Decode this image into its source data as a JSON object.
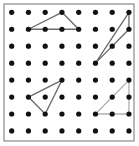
{
  "geoboard": {
    "rows": 8,
    "cols": 8,
    "origin_x": 11.7,
    "origin_y": 12.3,
    "spacing_x": 16.75,
    "spacing_y": 16.95,
    "border": {
      "x": 4,
      "y": 4,
      "w": 130,
      "h": 137,
      "color": "#8a8a8a"
    },
    "dot_color": "#111111",
    "dot_radius": 2.6,
    "triangles": [
      {
        "name": "triangle-top-left",
        "points": [
          [
            3,
            0
          ],
          [
            1,
            1
          ],
          [
            4,
            1
          ]
        ],
        "color": "#6a6a6a"
      },
      {
        "name": "triangle-top-right",
        "points": [
          [
            7,
            0
          ],
          [
            5,
            3
          ],
          [
            7,
            1
          ]
        ],
        "color": "#6a6a6a"
      },
      {
        "name": "triangle-middle-left",
        "points": [
          [
            3,
            4
          ],
          [
            1,
            5
          ],
          [
            2,
            6
          ]
        ],
        "color": "#6a6a6a"
      },
      {
        "name": "triangle-bottom-right",
        "points": [
          [
            7,
            4
          ],
          [
            5,
            6
          ],
          [
            7,
            6
          ]
        ],
        "color": "#b0b0b0"
      }
    ]
  }
}
